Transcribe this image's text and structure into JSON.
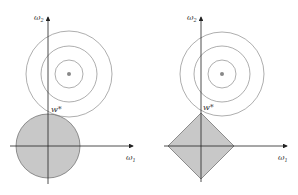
{
  "panels": [
    {
      "name": "l2-regularization",
      "y_axis_label": "ω",
      "y_axis_sub": "2",
      "x_axis_label": "ω",
      "x_axis_sub": "1",
      "optimum_label": "w*",
      "constraint_shape": "circle"
    },
    {
      "name": "l1-regularization",
      "y_axis_label": "ω",
      "y_axis_sub": "2",
      "x_axis_label": "ω",
      "x_axis_sub": "1",
      "optimum_label": "w*",
      "constraint_shape": "diamond"
    }
  ],
  "colors": {
    "region_fill": "#c8c8c8",
    "contour_stroke": "#777777",
    "axis_stroke": "#222222",
    "center_dot": "#888888"
  }
}
